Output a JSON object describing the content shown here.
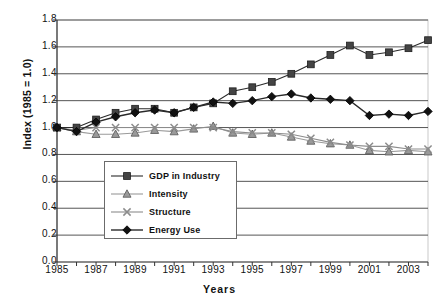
{
  "chart_data": {
    "type": "line",
    "title": "",
    "xlabel": "Years",
    "ylabel": "Index (1985 = 1.0)",
    "x": [
      1985,
      1986,
      1987,
      1988,
      1989,
      1990,
      1991,
      1992,
      1993,
      1994,
      1995,
      1996,
      1997,
      1998,
      1999,
      2000,
      2001,
      2002,
      2003,
      2004
    ],
    "xtick_labels": [
      "1985",
      "1987",
      "1989",
      "1991",
      "1993",
      "1995",
      "1997",
      "1999",
      "2001",
      "2003"
    ],
    "xtick_values": [
      1985,
      1987,
      1989,
      1991,
      1993,
      1995,
      1997,
      1999,
      2001,
      2003
    ],
    "ytick_labels": [
      "0.0",
      "0.2",
      "0.4",
      "0.6",
      "0.8",
      "1.0",
      "1.2",
      "1.4",
      "1.6",
      "1.8"
    ],
    "ytick_values": [
      0.0,
      0.2,
      0.4,
      0.6,
      0.8,
      1.0,
      1.2,
      1.4,
      1.6,
      1.8
    ],
    "ylim": [
      0.0,
      1.8
    ],
    "xlim": [
      1985,
      2004
    ],
    "grid": "horizontal",
    "legend_position": "center-left-inside",
    "series": [
      {
        "name": "GDP in Industry",
        "marker": "square",
        "color": "#444444",
        "values": [
          1.0,
          1.0,
          1.06,
          1.11,
          1.14,
          1.14,
          1.11,
          1.15,
          1.18,
          1.27,
          1.3,
          1.34,
          1.4,
          1.47,
          1.54,
          1.61,
          1.54,
          1.56,
          1.59,
          1.65
        ]
      },
      {
        "name": "Intensity",
        "marker": "triangle",
        "color": "#9a9a9a",
        "values": [
          1.0,
          0.97,
          0.95,
          0.95,
          0.96,
          0.98,
          0.97,
          0.99,
          1.01,
          0.96,
          0.95,
          0.96,
          0.93,
          0.9,
          0.88,
          0.87,
          0.83,
          0.82,
          0.83,
          0.82
        ]
      },
      {
        "name": "Structure",
        "marker": "x",
        "color": "#8c8c8c",
        "values": [
          1.0,
          0.98,
          1.0,
          1.0,
          1.0,
          1.0,
          1.0,
          1.0,
          1.0,
          0.97,
          0.96,
          0.96,
          0.95,
          0.92,
          0.89,
          0.87,
          0.86,
          0.86,
          0.84,
          0.84
        ]
      },
      {
        "name": "Energy Use",
        "marker": "diamond",
        "color": "#111111",
        "values": [
          1.0,
          0.97,
          1.04,
          1.08,
          1.11,
          1.13,
          1.11,
          1.15,
          1.19,
          1.18,
          1.2,
          1.23,
          1.25,
          1.22,
          1.21,
          1.2,
          1.09,
          1.1,
          1.09,
          1.12
        ]
      }
    ]
  },
  "legend": {
    "items": [
      {
        "label": "GDP in Industry"
      },
      {
        "label": "Intensity"
      },
      {
        "label": "Structure"
      },
      {
        "label": "Energy Use"
      }
    ]
  }
}
